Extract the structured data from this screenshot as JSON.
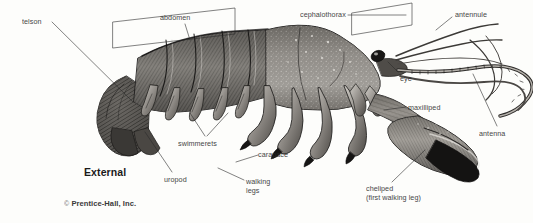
{
  "figure": {
    "title": "External",
    "credit_symbol": "©",
    "credit": "Prentice-Hall, Inc.",
    "ink_color": "#2b2b2b",
    "background_color": "#fdfdfb"
  },
  "labels": [
    {
      "id": "telson",
      "text": "telson",
      "x": 22,
      "y": 18
    },
    {
      "id": "abdomen",
      "text": "abdomen",
      "x": 160,
      "y": 14
    },
    {
      "id": "cephalothorax",
      "text": "cephalothorax",
      "x": 300,
      "y": 11
    },
    {
      "id": "antennule",
      "text": "antennule",
      "x": 455,
      "y": 11
    },
    {
      "id": "eye",
      "text": "eye",
      "x": 400,
      "y": 75
    },
    {
      "id": "maxilliped",
      "text": "maxilliped",
      "x": 408,
      "y": 104
    },
    {
      "id": "antenna",
      "text": "antenna",
      "x": 479,
      "y": 130
    },
    {
      "id": "swimmerets",
      "text": "swimmerets",
      "x": 178,
      "y": 140
    },
    {
      "id": "carapace",
      "text": "carapace",
      "x": 258,
      "y": 151
    },
    {
      "id": "uropod",
      "text": "uropod",
      "x": 164,
      "y": 176
    },
    {
      "id": "walking-legs",
      "text": "walking\nlegs",
      "x": 246,
      "y": 178
    },
    {
      "id": "cheliped",
      "text": "cheliped\n(first walking leg)",
      "x": 366,
      "y": 185
    }
  ],
  "leader_lines": [
    {
      "id": "telson-leader",
      "from": [
        52,
        22
      ],
      "to": [
        133,
        102
      ]
    },
    {
      "id": "abdomen-bracket-stem",
      "from": [
        185,
        24
      ],
      "to": [
        190,
        40
      ]
    },
    {
      "id": "cephalothorax-leader",
      "from": [
        348,
        15
      ],
      "to": [
        406,
        15
      ]
    },
    {
      "id": "antennule-leader",
      "from": [
        452,
        17
      ],
      "to": [
        436,
        30
      ]
    },
    {
      "id": "eye-leader",
      "from": [
        398,
        72
      ],
      "to": [
        388,
        62
      ]
    },
    {
      "id": "maxilliped-leader",
      "from": [
        406,
        107
      ],
      "to": [
        384,
        110
      ]
    },
    {
      "id": "antenna-leader",
      "from": [
        497,
        126
      ],
      "to": [
        473,
        74
      ]
    },
    {
      "id": "swimmerets-leader-l",
      "from": [
        205,
        136
      ],
      "to": [
        190,
        113
      ]
    },
    {
      "id": "swimmerets-leader-r",
      "from": [
        207,
        136
      ],
      "to": [
        228,
        113
      ]
    },
    {
      "id": "carapace-leader",
      "from": [
        258,
        155
      ],
      "to": [
        236,
        162
      ]
    },
    {
      "id": "uropod-leader",
      "from": [
        172,
        172
      ],
      "to": [
        145,
        132
      ]
    },
    {
      "id": "walking-legs-leader",
      "from": [
        244,
        180
      ],
      "to": [
        218,
        168
      ]
    },
    {
      "id": "cheliped-leader",
      "from": [
        392,
        182
      ],
      "to": [
        425,
        150
      ]
    }
  ],
  "brackets": [
    {
      "id": "abdomen-bracket",
      "x": 113,
      "y": 22,
      "w": 122,
      "h": 26,
      "skew": -14
    },
    {
      "id": "cephalothorax-bracket",
      "x": 352,
      "y": 13,
      "w": 60,
      "h": 22,
      "skew": -10
    }
  ]
}
